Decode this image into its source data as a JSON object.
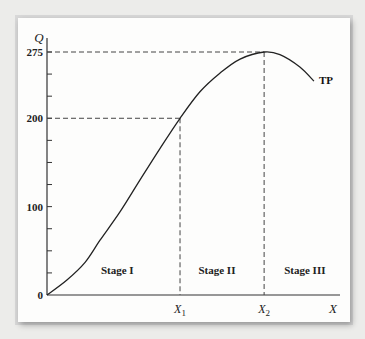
{
  "chart_data": {
    "type": "line",
    "title": "",
    "xlabel": "X",
    "ylabel": "Q",
    "xlim": [
      0,
      100
    ],
    "ylim": [
      0,
      275
    ],
    "grid": false,
    "legend": "none",
    "y_tick_labels": [
      {
        "value": 0,
        "label": "0"
      },
      {
        "value": 100,
        "label": "100"
      },
      {
        "value": 200,
        "label": "200"
      },
      {
        "value": 275,
        "label": "275"
      }
    ],
    "y_minor_tick_step": 25,
    "x_markers": [
      {
        "name": "X1",
        "label": "X",
        "subscript": "1",
        "x": 45.4,
        "q": 200
      },
      {
        "name": "X2",
        "label": "X",
        "subscript": "2",
        "x": 74.1,
        "q": 275
      }
    ],
    "stages": [
      {
        "label": "Stage I",
        "x_center": 24
      },
      {
        "label": "Stage II",
        "x_center": 58
      },
      {
        "label": "Stage III",
        "x_center": 88
      }
    ],
    "series": [
      {
        "name": "TP",
        "label": "TP",
        "x": [
          0,
          6.8,
          13,
          18.1,
          24.9,
          31.7,
          38.6,
          45.4,
          52.2,
          59,
          65.9,
          74.1,
          79.5,
          86.3,
          91.1
        ],
        "y": [
          0,
          17,
          37,
          62,
          94,
          130,
          166,
          200,
          230,
          251,
          267,
          275,
          272,
          258,
          242
        ]
      }
    ]
  }
}
